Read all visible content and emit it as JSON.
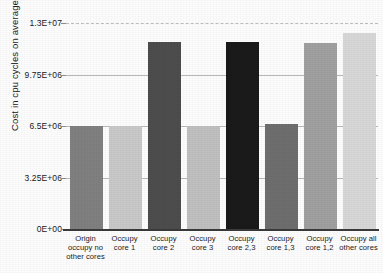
{
  "chart_data": {
    "type": "bar",
    "title": "",
    "xlabel": "",
    "ylabel": "Cost in cpu cycles on average",
    "ylim": [
      0,
      13000000
    ],
    "grid": true,
    "legend": "none",
    "categories": [
      "Origin occupy no other cores",
      "Occupy core 1",
      "Occupy core 2",
      "Occupy core 3",
      "Occupy core 2,3",
      "Occupy core 1,3",
      "Occupy core 1,2",
      "Occupy all other cores"
    ],
    "values": [
      6500000,
      6520000,
      11800000,
      6530000,
      11800000,
      6600000,
      11750000,
      12400000
    ],
    "ytick_labels": [
      "1.3E+07",
      "9.75E+06",
      "6.5E+06",
      "3.25E+06",
      "0E+00"
    ],
    "ytick_values": [
      13000000,
      9750000,
      6500000,
      3250000,
      0
    ],
    "bar_colors": [
      "#808080",
      "#c9c9c9",
      "#4d4d4d",
      "#c0c0c0",
      "#1a1a1a",
      "#6e6e6e",
      "#a0a0a0",
      "#d8d8d8"
    ]
  },
  "axis": {
    "y_title": "Cost in cpu cycles on average",
    "ticks": [
      {
        "label": "1.3E+07",
        "value": 13000000
      },
      {
        "label": "9.75E+06",
        "value": 9750000
      },
      {
        "label": "6.5E+06",
        "value": 6500000
      },
      {
        "label": "3.25E+06",
        "value": 3250000
      },
      {
        "label": "0E+00",
        "value": 0
      }
    ]
  },
  "bars": [
    {
      "label_line1": "Origin",
      "label_line2": "occupy no",
      "label_line3": "other cores",
      "value": 6500000,
      "color": "#808080"
    },
    {
      "label_line1": "Occupy",
      "label_line2": "core 1",
      "label_line3": "",
      "value": 6520000,
      "color": "#c9c9c9"
    },
    {
      "label_line1": "Occupy",
      "label_line2": "core 2",
      "label_line3": "",
      "value": 11800000,
      "color": "#4d4d4d"
    },
    {
      "label_line1": "Occupy",
      "label_line2": "core 3",
      "label_line3": "",
      "value": 6530000,
      "color": "#c0c0c0"
    },
    {
      "label_line1": "Occupy",
      "label_line2": "core 2,3",
      "label_line3": "",
      "value": 11800000,
      "color": "#1a1a1a"
    },
    {
      "label_line1": "Occupy",
      "label_line2": "core 1,3",
      "label_line3": "",
      "value": 6600000,
      "color": "#6e6e6e"
    },
    {
      "label_line1": "Occupy",
      "label_line2": "core 1,2",
      "label_line3": "",
      "value": 11750000,
      "color": "#a0a0a0"
    },
    {
      "label_line1": "Occupy all",
      "label_line2": "other cores",
      "label_line3": "",
      "value": 12400000,
      "color": "#d8d8d8"
    }
  ]
}
